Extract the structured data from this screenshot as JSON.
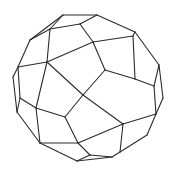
{
  "diagram": {
    "title": "",
    "type": "polyhedron-wireframe",
    "stroke_color": "#2b2b2b",
    "background_color": "#ffffff",
    "vertices": {
      "A": [
        63,
        15
      ],
      "B": [
        97,
        15
      ],
      "C": [
        80,
        24
      ],
      "D": [
        50,
        29
      ],
      "E": [
        30,
        40
      ],
      "F": [
        93,
        42
      ],
      "G": [
        133,
        36
      ],
      "H": [
        135,
        32
      ],
      "I": [
        47,
        62
      ],
      "J": [
        18,
        67
      ],
      "K": [
        13,
        77
      ],
      "L": [
        20,
        98
      ],
      "M": [
        17,
        112
      ],
      "N": [
        36,
        108
      ],
      "O": [
        65,
        117
      ],
      "P": [
        83,
        95
      ],
      "Q": [
        105,
        70
      ],
      "R": [
        135,
        79
      ],
      "S": [
        159,
        65
      ],
      "T": [
        154,
        86
      ],
      "U": [
        163,
        98
      ],
      "V": [
        156,
        114
      ],
      "W": [
        123,
        124
      ],
      "X": [
        40,
        143
      ],
      "Y": [
        78,
        143
      ],
      "Z": [
        120,
        152
      ],
      "AA": [
        147,
        135
      ],
      "AB": [
        90,
        155
      ],
      "AC": [
        77,
        161
      ],
      "AD": [
        112,
        157
      ]
    },
    "edges": [
      [
        "A",
        "B"
      ],
      [
        "A",
        "D"
      ],
      [
        "A",
        "E"
      ],
      [
        "B",
        "C"
      ],
      [
        "C",
        "D"
      ],
      [
        "B",
        "H"
      ],
      [
        "C",
        "F"
      ],
      [
        "D",
        "I"
      ],
      [
        "E",
        "J"
      ],
      [
        "E",
        "D"
      ],
      [
        "F",
        "G"
      ],
      [
        "F",
        "Q"
      ],
      [
        "G",
        "H"
      ],
      [
        "G",
        "R"
      ],
      [
        "H",
        "S"
      ],
      [
        "I",
        "F"
      ],
      [
        "I",
        "J"
      ],
      [
        "I",
        "N"
      ],
      [
        "I",
        "P"
      ],
      [
        "J",
        "K"
      ],
      [
        "K",
        "M"
      ],
      [
        "J",
        "L"
      ],
      [
        "L",
        "N"
      ],
      [
        "L",
        "M"
      ],
      [
        "N",
        "O"
      ],
      [
        "N",
        "X"
      ],
      [
        "M",
        "X"
      ],
      [
        "O",
        "P"
      ],
      [
        "O",
        "Y"
      ],
      [
        "P",
        "Q"
      ],
      [
        "P",
        "W"
      ],
      [
        "Q",
        "R"
      ],
      [
        "R",
        "T"
      ],
      [
        "S",
        "T"
      ],
      [
        "S",
        "U"
      ],
      [
        "T",
        "V"
      ],
      [
        "U",
        "V"
      ],
      [
        "V",
        "W"
      ],
      [
        "V",
        "AA"
      ],
      [
        "W",
        "Z"
      ],
      [
        "W",
        "Y"
      ],
      [
        "X",
        "Y"
      ],
      [
        "X",
        "AC"
      ],
      [
        "Y",
        "AB"
      ],
      [
        "AB",
        "AD"
      ],
      [
        "AC",
        "AD"
      ],
      [
        "AB",
        "AC"
      ],
      [
        "Z",
        "AD"
      ],
      [
        "Z",
        "AA"
      ]
    ]
  }
}
